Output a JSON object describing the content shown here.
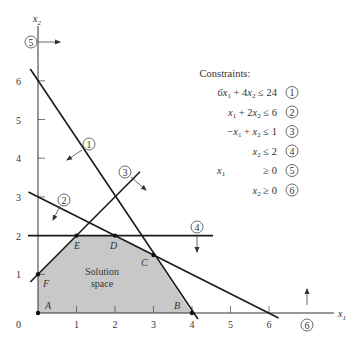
{
  "diagram": {
    "axes": {
      "x_label": "x1",
      "y_label": "x2",
      "origin_label": "0",
      "x_ticks": [
        "1",
        "2",
        "3",
        "4",
        "5",
        "6"
      ],
      "y_ticks": [
        "1",
        "2",
        "3",
        "4",
        "5",
        "6"
      ]
    },
    "constraints_title": "Constraints:",
    "constraints": [
      {
        "num": "1",
        "lhs": "6x1 + 4x2",
        "op": "≤",
        "rhs": "24"
      },
      {
        "num": "2",
        "lhs": "x1 + 2x2",
        "op": "≤",
        "rhs": "6"
      },
      {
        "num": "3",
        "lhs": "−x1 + x2",
        "op": "≤",
        "rhs": "1"
      },
      {
        "num": "4",
        "lhs": "x2",
        "op": "≤",
        "rhs": "2"
      },
      {
        "num": "5",
        "lhs": "x1",
        "op": "≥",
        "rhs": "0"
      },
      {
        "num": "6",
        "lhs": "x2",
        "op": "≥",
        "rhs": "0"
      }
    ],
    "vertices": [
      {
        "label": "A",
        "x": 0,
        "y": 0
      },
      {
        "label": "B",
        "x": 4,
        "y": 0
      },
      {
        "label": "C",
        "x": 3,
        "y": 1.5
      },
      {
        "label": "D",
        "x": 2,
        "y": 2
      },
      {
        "label": "E",
        "x": 1,
        "y": 2
      },
      {
        "label": "F",
        "x": 0,
        "y": 1
      }
    ],
    "region_label_line1": "Solution",
    "region_label_line2": "space",
    "colors": {
      "region_fill": "#c8c8c8",
      "line": "#1a1a1a",
      "text": "#333333"
    }
  }
}
